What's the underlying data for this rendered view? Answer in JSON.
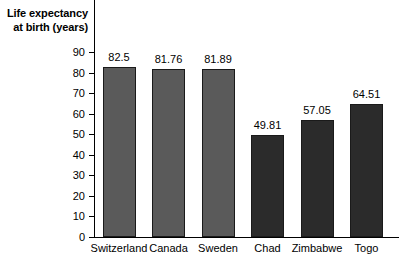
{
  "chart_data": {
    "type": "bar",
    "title": "",
    "ylabel": "Life expectancy at birth (years)",
    "ylabel_line1": "Life expectancy",
    "ylabel_line2": "at birth (years)",
    "xlabel": "",
    "categories": [
      "Switzerland",
      "Canada",
      "Sweden",
      "Chad",
      "Zimbabwe",
      "Togo"
    ],
    "values": [
      82.5,
      81.76,
      81.89,
      49.81,
      57.05,
      64.51
    ],
    "value_labels": [
      "82.5",
      "81.76",
      "81.89",
      "49.81",
      "57.05",
      "64.51"
    ],
    "bar_colors": [
      "#5a5a5a",
      "#5a5a5a",
      "#5a5a5a",
      "#2b2b2b",
      "#2b2b2b",
      "#2b2b2b"
    ],
    "ylim": [
      0,
      90
    ],
    "yticks": [
      0,
      10,
      20,
      30,
      40,
      50,
      60,
      70,
      80,
      90
    ],
    "ytick_labels": [
      "0",
      "10",
      "20",
      "30",
      "40",
      "50",
      "60",
      "70",
      "80",
      "90"
    ],
    "grid": false,
    "legend": null
  }
}
